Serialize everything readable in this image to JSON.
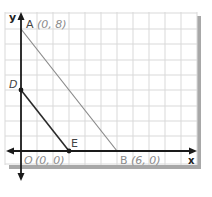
{
  "axes": {
    "x_label": "x",
    "y_label": "y"
  },
  "points": [
    {
      "name": "A",
      "label": "A",
      "coords": "(0, 8)"
    },
    {
      "name": "B",
      "label": "B",
      "coords": "(6, 0)"
    },
    {
      "name": "O",
      "label": "O",
      "coords": "(0, 0)"
    },
    {
      "name": "D",
      "label": "D",
      "coords": ""
    },
    {
      "name": "E",
      "label": "E",
      "coords": ""
    }
  ],
  "segments": [
    {
      "from": "A",
      "to": "B"
    },
    {
      "from": "D",
      "to": "E"
    }
  ],
  "colors": {
    "grid": "#d9d9d9",
    "axis": "#1a1a1a",
    "segment_AB": "#8a8a8a",
    "segment_DE": "#2a2a2a",
    "coord_text": "#8c8c8c",
    "shadow": "#a8a8a8"
  }
}
